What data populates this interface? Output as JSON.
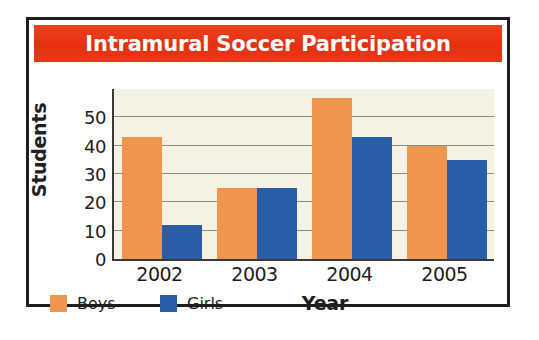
{
  "figure": {
    "title": "Intramural Soccer Participation",
    "title_bar_color": "#e8351c",
    "title_text_color": "#ffffff",
    "frame_color": "#201d1c",
    "plot_background_color": "#f5f2e4",
    "gridline_color": "#8e8b85"
  },
  "legend": {
    "items": [
      {
        "label": "Boys",
        "color": "#f0954e",
        "swatch_name": "legend-swatch-boys"
      },
      {
        "label": "Girls",
        "color": "#2b5ca8",
        "swatch_name": "legend-swatch-girls"
      }
    ]
  },
  "axes": {
    "y_title": "Students",
    "x_title": "Year",
    "y_ticks": [
      "0",
      "10",
      "20",
      "30",
      "40",
      "50"
    ],
    "x_ticks": [
      "2002",
      "2003",
      "2004",
      "2005"
    ]
  },
  "chart_data": {
    "type": "bar",
    "title": "Intramural Soccer Participation",
    "xlabel": "Year",
    "ylabel": "Students",
    "categories": [
      "2002",
      "2003",
      "2004",
      "2005"
    ],
    "series": [
      {
        "name": "Boys",
        "color": "#f0954e",
        "values": [
          43,
          25,
          57,
          40
        ]
      },
      {
        "name": "Girls",
        "color": "#2b5ca8",
        "values": [
          12,
          25,
          43,
          35
        ]
      }
    ],
    "ylim": [
      0,
      60
    ],
    "ytick_values": [
      0,
      10,
      20,
      30,
      40,
      50
    ],
    "grid": true,
    "grid_axis": "y",
    "legend_position": "bottom-left",
    "bar_mode": "grouped"
  }
}
